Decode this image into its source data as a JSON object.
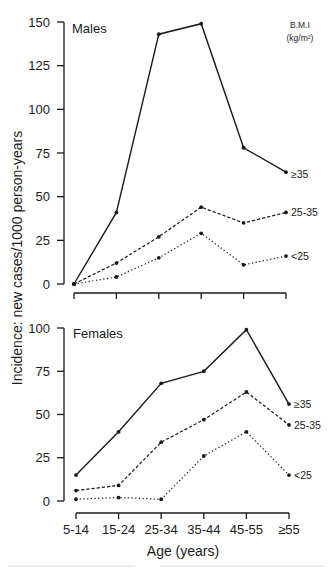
{
  "chart_data": [
    {
      "type": "line",
      "panel": "Males",
      "title": "Males",
      "xlabel": "Age (years)",
      "ylabel": "Incidence: new cases/1000 person-years",
      "categories": [
        "5-14",
        "15-24",
        "25-34",
        "35-44",
        "45-55",
        "≥55"
      ],
      "ylim": [
        0,
        150
      ],
      "yticks": [
        0,
        25,
        50,
        75,
        100,
        125,
        150
      ],
      "grid": false,
      "legend_title": "B.M.I (kg/m²)",
      "legend_position": "right, inline labels at line ends",
      "series": [
        {
          "name": "≥35",
          "style": "solid",
          "values": [
            0,
            41,
            143,
            149,
            78,
            64
          ]
        },
        {
          "name": "25-35",
          "style": "dashed",
          "values": [
            0,
            12,
            27,
            44,
            35,
            41
          ]
        },
        {
          "name": "<25",
          "style": "dotted",
          "values": [
            0,
            4,
            15,
            29,
            11,
            16
          ]
        }
      ]
    },
    {
      "type": "line",
      "panel": "Females",
      "title": "Females",
      "xlabel": "Age (years)",
      "ylabel": "Incidence: new cases/1000 person-years",
      "categories": [
        "5-14",
        "15-24",
        "25-34",
        "35-44",
        "45-55",
        "≥55"
      ],
      "ylim": [
        0,
        100
      ],
      "yticks": [
        0,
        25,
        50,
        75,
        100
      ],
      "grid": false,
      "legend_position": "right, inline labels at line ends",
      "series": [
        {
          "name": "≥35",
          "style": "solid",
          "values": [
            15,
            40,
            68,
            75,
            99,
            56
          ]
        },
        {
          "name": "25-35",
          "style": "dashed",
          "values": [
            6,
            9,
            34,
            47,
            63,
            44
          ]
        },
        {
          "name": "<25",
          "style": "dotted",
          "values": [
            1,
            2,
            1,
            26,
            40,
            15
          ]
        }
      ]
    }
  ],
  "labels": {
    "males_title": "Males",
    "females_title": "Females",
    "legend_title_line1": "B.M.I",
    "legend_title_line2": "(kg/m²)",
    "y_axis_title": "Incidence: new cases/1000 person-years",
    "x_axis_title": "Age (years)"
  },
  "colors": {
    "ink": "#1a1a1a",
    "background": "#ffffff"
  }
}
